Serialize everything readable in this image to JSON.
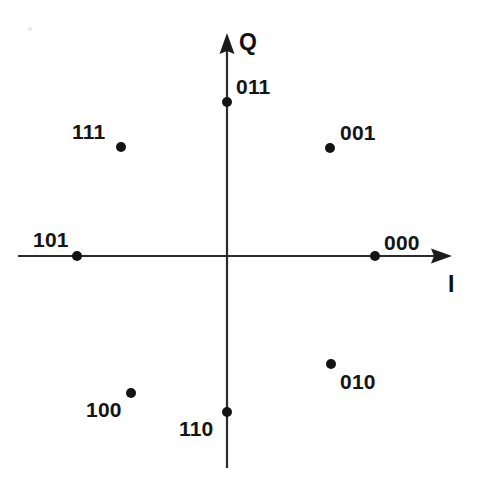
{
  "figure": {
    "background_color": "#ffffff",
    "ink_color": "#141414",
    "width": 479,
    "height": 478
  },
  "axes": {
    "horizontal": {
      "name": "I",
      "label": "I",
      "label_x": 448,
      "label_y": 273,
      "x_start": 18,
      "x_end": 452,
      "y": 256,
      "arrow": "right"
    },
    "vertical": {
      "name": "Q",
      "label": "Q",
      "label_x": 239,
      "label_y": 31,
      "y_start": 33,
      "y_end": 468,
      "x": 227,
      "arrow": "up"
    },
    "origin": {
      "x": 227,
      "y": 256
    }
  },
  "chart_data": {
    "type": "scatter",
    "xlabel": "I",
    "ylabel": "Q",
    "grid": false,
    "legend": false,
    "xlim": [
      -2,
      2
    ],
    "ylim": [
      -2,
      2
    ],
    "point_radius_px": 5,
    "origin_px": {
      "x": 227,
      "y": 256
    },
    "points": [
      {
        "label": "000",
        "x": 1.0,
        "y": 0.0,
        "angle_deg": 0,
        "px": 375,
        "py": 256,
        "label_px": 384,
        "label_py": 232,
        "label_anchor": "above-right"
      },
      {
        "label": "001",
        "x": 0.707,
        "y": 0.707,
        "angle_deg": 45,
        "px": 330,
        "py": 148,
        "label_px": 340,
        "label_py": 122,
        "label_anchor": "above-right"
      },
      {
        "label": "011",
        "x": 0.0,
        "y": 1.0,
        "angle_deg": 90,
        "px": 227,
        "py": 102,
        "label_px": 236,
        "label_py": 76,
        "label_anchor": "above-right"
      },
      {
        "label": "111",
        "x": -0.707,
        "y": 0.707,
        "angle_deg": 135,
        "px": 121,
        "py": 147,
        "label_px": 72,
        "label_py": 121,
        "label_anchor": "above-left"
      },
      {
        "label": "101",
        "x": -1.0,
        "y": 0.0,
        "angle_deg": 180,
        "px": 77,
        "py": 256,
        "label_px": 33,
        "label_py": 229,
        "label_anchor": "above-left"
      },
      {
        "label": "100",
        "x": -0.707,
        "y": -0.707,
        "angle_deg": 225,
        "px": 131,
        "py": 393,
        "label_px": 86,
        "label_py": 399,
        "label_anchor": "below-left"
      },
      {
        "label": "110",
        "x": 0.0,
        "y": -1.0,
        "angle_deg": 270,
        "px": 227,
        "py": 412,
        "label_px": 179,
        "label_py": 418,
        "label_anchor": "below-left"
      },
      {
        "label": "010",
        "x": 0.707,
        "y": -0.707,
        "angle_deg": 315,
        "px": 331,
        "py": 364,
        "label_px": 340,
        "label_py": 371,
        "label_anchor": "below-right"
      }
    ]
  }
}
